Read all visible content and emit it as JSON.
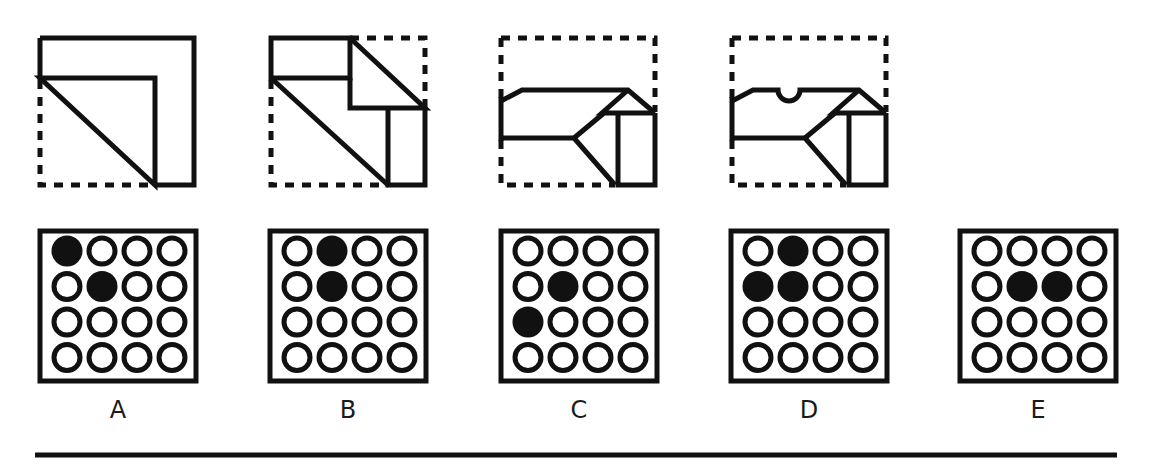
{
  "puzzle": {
    "type": "paper-folding-punch",
    "colors": {
      "ink": "#111111",
      "background": "#ffffff"
    },
    "fold_steps": [
      {
        "id": "step-1",
        "description": "square folded: bottom-left triangle folded up to top-right, forming L strip with diagonal"
      },
      {
        "id": "step-2",
        "description": "top-right corner folded down-left"
      },
      {
        "id": "step-3",
        "description": "top portion folded down"
      },
      {
        "id": "step-4",
        "description": "semicircle hole punched in top edge"
      }
    ],
    "options": [
      {
        "label": "A",
        "filled": [
          [
            0,
            0
          ],
          [
            1,
            1
          ]
        ]
      },
      {
        "label": "B",
        "filled": [
          [
            0,
            1
          ],
          [
            1,
            1
          ]
        ]
      },
      {
        "label": "C",
        "filled": [
          [
            1,
            1
          ],
          [
            2,
            0
          ]
        ]
      },
      {
        "label": "D",
        "filled": [
          [
            0,
            1
          ],
          [
            1,
            0
          ],
          [
            1,
            1
          ]
        ]
      },
      {
        "label": "E",
        "filled": [
          [
            1,
            1
          ],
          [
            1,
            2
          ]
        ]
      }
    ],
    "grid": {
      "rows": 4,
      "cols": 4
    }
  }
}
